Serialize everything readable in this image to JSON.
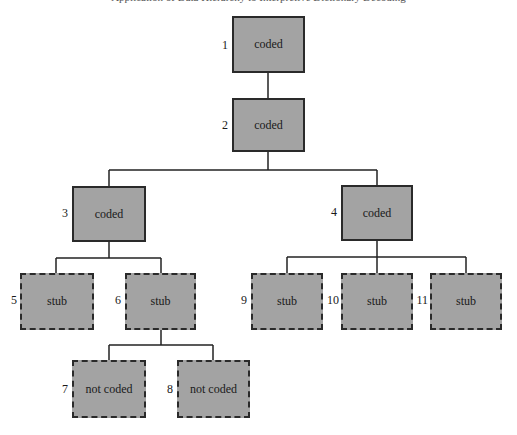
{
  "header_fragment": "Application of Data Hierarchy to Interpretive Dictionary Decoding",
  "nodes": [
    {
      "id": "1",
      "label": "coded",
      "style": "solid"
    },
    {
      "id": "2",
      "label": "coded",
      "style": "solid"
    },
    {
      "id": "3",
      "label": "coded",
      "style": "solid"
    },
    {
      "id": "4",
      "label": "coded",
      "style": "solid"
    },
    {
      "id": "5",
      "label": "stub",
      "style": "dashed"
    },
    {
      "id": "6",
      "label": "stub",
      "style": "dashed"
    },
    {
      "id": "7",
      "label": "not coded",
      "style": "dashed"
    },
    {
      "id": "8",
      "label": "not coded",
      "style": "dashed"
    },
    {
      "id": "9",
      "label": "stub",
      "style": "dashed"
    },
    {
      "id": "10",
      "label": "stub",
      "style": "dashed"
    },
    {
      "id": "11",
      "label": "stub",
      "style": "dashed"
    }
  ],
  "edges": [
    [
      "1",
      "2"
    ],
    [
      "2",
      "3"
    ],
    [
      "2",
      "4"
    ],
    [
      "3",
      "5"
    ],
    [
      "3",
      "6"
    ],
    [
      "6",
      "7"
    ],
    [
      "6",
      "8"
    ],
    [
      "4",
      "9"
    ],
    [
      "4",
      "10"
    ],
    [
      "4",
      "11"
    ]
  ],
  "colors": {
    "node_fill": "#a3a3a3",
    "border": "#2a2a2a",
    "line": "#222222"
  }
}
